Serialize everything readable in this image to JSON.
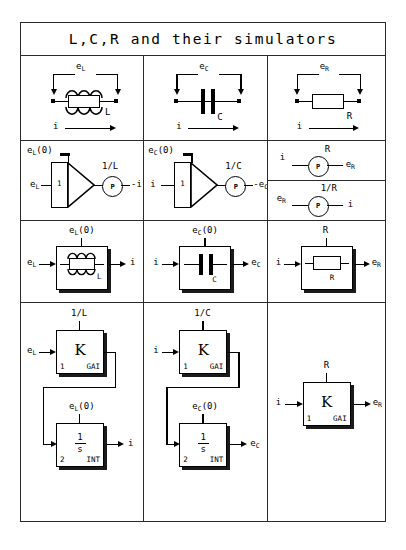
{
  "title": "L,C,R and their simulators",
  "rows": {
    "row1": {
      "name": "physical-element-row",
      "inductor": {
        "voltage": "e",
        "voltage_sub": "L",
        "element_label": "L",
        "current": "i"
      },
      "capacitor": {
        "voltage": "e",
        "voltage_sub": "C",
        "element_label": "C",
        "current": "i"
      },
      "resistor": {
        "voltage": "e",
        "voltage_sub": "R",
        "element_label": "R",
        "current": "i"
      }
    },
    "row2": {
      "name": "analog-computer-row",
      "inductor": {
        "initial_condition": "e",
        "initial_condition_sub": "L",
        "initial_condition_arg": "(0)",
        "input": "e",
        "input_sub": "L",
        "amp_label": "1",
        "gain": "1/L",
        "pot_label": "P",
        "output": "-i"
      },
      "capacitor": {
        "initial_condition": "e",
        "initial_condition_sub": "C",
        "initial_condition_arg": "(0)",
        "input": "i",
        "amp_label": "1",
        "gain": "1/C",
        "pot_label": "P",
        "output": "-e",
        "output_sub": "C"
      },
      "resistor_top": {
        "input": "i",
        "gain": "R",
        "pot_label": "P",
        "output": "e",
        "output_sub": "R"
      },
      "resistor_bottom": {
        "input": "e",
        "input_sub": "R",
        "gain": "1/R",
        "pot_label": "P",
        "output": "i"
      }
    },
    "row3": {
      "name": "block-element-row",
      "inductor": {
        "top_label": "e",
        "top_label_sub": "L",
        "top_label_arg": "(0)",
        "input": "e",
        "input_sub": "L",
        "element_label": "L",
        "output": "i"
      },
      "capacitor": {
        "top_label": "e",
        "top_label_sub": "C",
        "top_label_arg": "(0)",
        "input": "i",
        "element_label": "C",
        "output": "e",
        "output_sub": "C"
      },
      "resistor": {
        "top_label": "R",
        "input": "i",
        "element_label": "R",
        "output": "e",
        "output_sub": "R"
      }
    },
    "row4": {
      "name": "simulator-block-diagram-row",
      "inductor": {
        "gain_top": "1/L",
        "gain_input": "e",
        "gain_input_sub": "L",
        "gain_symbol": "K",
        "gain_corner_left": "1",
        "gain_corner_right": "GAI",
        "int_top": "e",
        "int_top_sub": "L",
        "int_top_arg": "(0)",
        "int_numerator": "1",
        "int_denominator": "s",
        "int_corner_left": "2",
        "int_corner_right": "INT",
        "int_output": "i"
      },
      "capacitor": {
        "gain_top": "1/C",
        "gain_input": "i",
        "gain_symbol": "K",
        "gain_corner_left": "1",
        "gain_corner_right": "GAI",
        "int_top": "e",
        "int_top_sub": "C",
        "int_top_arg": "(0)",
        "int_numerator": "1",
        "int_denominator": "s",
        "int_corner_left": "2",
        "int_corner_right": "INT",
        "int_output": "e",
        "int_output_sub": "C"
      },
      "resistor": {
        "gain_top": "R",
        "gain_input": "i",
        "gain_symbol": "K",
        "gain_corner_left": "1",
        "gain_corner_right": "GAI",
        "gain_output": "e",
        "gain_output_sub": "R"
      }
    }
  },
  "colors": {
    "ink": "#000000",
    "border": "#2b2b2b",
    "shadow": "#1a1a1a",
    "background": "#ffffff"
  }
}
